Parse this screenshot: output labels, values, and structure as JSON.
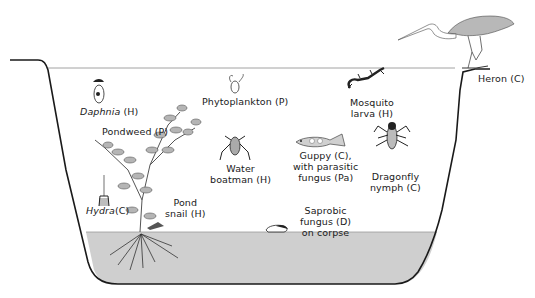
{
  "diagram": {
    "type": "pond-ecosystem",
    "colors": {
      "outline": "#1a1a1a",
      "sediment": "#cfcfcf",
      "surface_line": "#8a8a8a",
      "plant_fill": "#b5b5b5",
      "heron_body": "#b8b8b8",
      "background": "#ffffff"
    },
    "organisms": [
      {
        "id": "daphnia",
        "name": "Daphnia",
        "role": "(H)",
        "italic": true
      },
      {
        "id": "phytoplankton",
        "name": "Phytoplankton",
        "role": "(P)"
      },
      {
        "id": "mosquito",
        "line1": "Mosquito",
        "line2": "larva (H)"
      },
      {
        "id": "heron",
        "name": "Heron",
        "role": "(C)"
      },
      {
        "id": "pondweed",
        "name": "Pondweed",
        "role": "(P)"
      },
      {
        "id": "water_boatman",
        "line1": "Water",
        "line2": "boatman (H)"
      },
      {
        "id": "guppy",
        "line1": "Guppy (C),",
        "line2": "with parasitic",
        "line3": "fungus (Pa)"
      },
      {
        "id": "dragonfly",
        "line1": "Dragonfly",
        "line2": "nymph (C)"
      },
      {
        "id": "hydra",
        "name": "Hydra",
        "role": "(C)",
        "italic": true
      },
      {
        "id": "pond_snail",
        "line1": "Pond",
        "line2": "snail (H)"
      },
      {
        "id": "saprobic",
        "line1": "Saprobic",
        "line2": "fungus (D)",
        "line3": "on corpse"
      }
    ]
  },
  "labels": {
    "daphnia_name": "Daphnia",
    "daphnia_role": "(H)",
    "phytoplankton": "Phytoplankton (P)",
    "mosquito_1": "Mosquito",
    "mosquito_2": "larva (H)",
    "heron": "Heron (C)",
    "pondweed": "Pondweed (P)",
    "boatman_1": "Water",
    "boatman_2": "boatman (H)",
    "guppy_1": "Guppy (C),",
    "guppy_2": "with parasitic",
    "guppy_3": "fungus (Pa)",
    "dragonfly_1": "Dragonfly",
    "dragonfly_2": "nymph (C)",
    "hydra_name": "Hydra",
    "hydra_role": "(C)",
    "snail_1": "Pond",
    "snail_2": "snail (H)",
    "saprobic_1": "Saprobic",
    "saprobic_2": "fungus (D)",
    "saprobic_3": "on corpse"
  }
}
